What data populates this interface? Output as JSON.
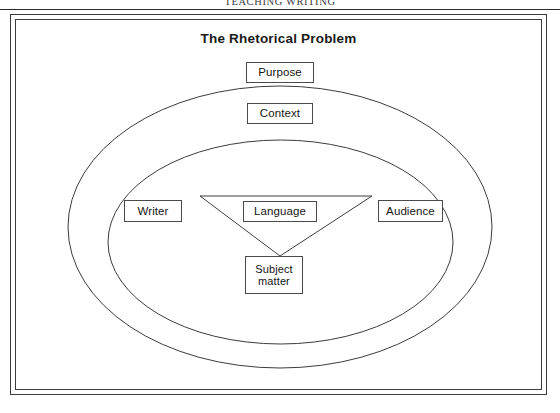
{
  "running_head": {
    "text": "TEACHING WRITING"
  },
  "figure": {
    "title": "The Rhetorical Problem",
    "nodes": {
      "purpose": "Purpose",
      "context": "Context",
      "writer": "Writer",
      "language": "Language",
      "audience": "Audience",
      "subject_line1": "Subject",
      "subject_line2": "matter"
    },
    "shapes": {
      "outer_ellipse": "outer-ellipse",
      "inner_ellipse": "inner-ellipse",
      "triangle": "inverted-triangle"
    }
  },
  "colors": {
    "ink": "#3c3c3c",
    "text": "#151515",
    "page": "#ffffff",
    "rule": "#2b2b2b"
  }
}
